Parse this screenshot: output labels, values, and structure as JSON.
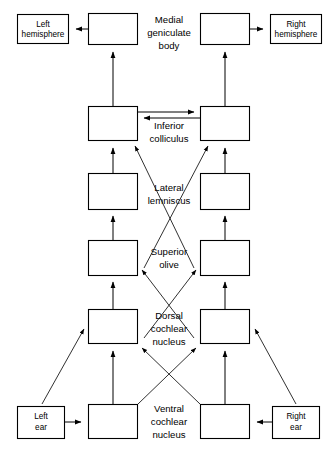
{
  "diagram": {
    "colors": {
      "stroke": "#000000",
      "background": "#ffffff",
      "box_fill": "#ffffff"
    },
    "boxes": [
      {
        "id": "left-hemisphere",
        "label_line1": "Left",
        "label_line2": "hemisphere",
        "x": 17,
        "y": 14,
        "w": 52,
        "h": 30
      },
      {
        "id": "right-hemisphere",
        "label_line1": "Right",
        "label_line2": "hemisphere",
        "x": 270,
        "y": 14,
        "w": 52,
        "h": 30
      },
      {
        "id": "mgb-left",
        "label_line1": "",
        "label_line2": "",
        "x": 88,
        "y": 13,
        "w": 50,
        "h": 32
      },
      {
        "id": "mgb-right",
        "label_line1": "",
        "label_line2": "",
        "x": 200,
        "y": 13,
        "w": 50,
        "h": 32
      },
      {
        "id": "ic-left",
        "label_line1": "",
        "label_line2": "",
        "x": 88,
        "y": 106,
        "w": 50,
        "h": 35
      },
      {
        "id": "ic-right",
        "label_line1": "",
        "label_line2": "",
        "x": 200,
        "y": 106,
        "w": 50,
        "h": 35
      },
      {
        "id": "ll-left",
        "label_line1": "",
        "label_line2": "",
        "x": 88,
        "y": 173,
        "w": 50,
        "h": 37
      },
      {
        "id": "ll-right",
        "label_line1": "",
        "label_line2": "",
        "x": 200,
        "y": 173,
        "w": 50,
        "h": 37
      },
      {
        "id": "so-left",
        "label_line1": "",
        "label_line2": "",
        "x": 88,
        "y": 240,
        "w": 50,
        "h": 36
      },
      {
        "id": "so-right",
        "label_line1": "",
        "label_line2": "",
        "x": 200,
        "y": 240,
        "w": 50,
        "h": 36
      },
      {
        "id": "dcn-left",
        "label_line1": "",
        "label_line2": "",
        "x": 88,
        "y": 309,
        "w": 50,
        "h": 35
      },
      {
        "id": "dcn-right",
        "label_line1": "",
        "label_line2": "",
        "x": 200,
        "y": 309,
        "w": 50,
        "h": 35
      },
      {
        "id": "vcn-left",
        "label_line1": "",
        "label_line2": "",
        "x": 88,
        "y": 404,
        "w": 50,
        "h": 35
      },
      {
        "id": "vcn-right",
        "label_line1": "",
        "label_line2": "",
        "x": 200,
        "y": 404,
        "w": 50,
        "h": 35
      },
      {
        "id": "left-ear",
        "label_line1": "Left",
        "label_line2": "ear",
        "x": 17,
        "y": 406,
        "w": 48,
        "h": 33
      },
      {
        "id": "right-ear",
        "label_line1": "Right",
        "label_line2": "ear",
        "x": 272,
        "y": 406,
        "w": 48,
        "h": 33
      }
    ],
    "center_labels": [
      {
        "id": "medial-geniculate-body",
        "lines": [
          "Medial",
          "geniculate",
          "body"
        ],
        "cx": 169,
        "cy": 30
      },
      {
        "id": "inferior-colliculus",
        "lines": [
          "Inferior",
          "colliculus"
        ],
        "cx": 169,
        "cy": 128
      },
      {
        "id": "lateral-lemniscus",
        "lines": [
          "Lateral",
          "lemniscus"
        ],
        "cx": 169,
        "cy": 191
      },
      {
        "id": "superior-olive",
        "lines": [
          "Superior",
          "olive"
        ],
        "cx": 169,
        "cy": 257
      },
      {
        "id": "dorsal-cochlear-nucleus",
        "lines": [
          "Dorsal",
          "cochlear",
          "nucleus"
        ],
        "cx": 169,
        "cy": 325
      },
      {
        "id": "ventral-cochlear-nucleus",
        "lines": [
          "Ventral",
          "cochlear",
          "nucleus"
        ],
        "cx": 169,
        "cy": 421
      }
    ],
    "connections": [
      {
        "id": "mgb-left-to-left-hemisphere",
        "from": "mgb-left",
        "to": "left-hemisphere",
        "kind": "arrow-left"
      },
      {
        "id": "mgb-right-to-right-hemisphere",
        "from": "mgb-right",
        "to": "right-hemisphere",
        "kind": "arrow-right"
      },
      {
        "id": "ic-left-to-mgb-left",
        "from": "ic-left",
        "to": "mgb-left",
        "kind": "arrow-up"
      },
      {
        "id": "ic-right-to-mgb-right",
        "from": "ic-right",
        "to": "mgb-right",
        "kind": "arrow-up"
      },
      {
        "id": "ic-left-to-ic-right",
        "from": "ic-left",
        "to": "ic-right",
        "kind": "arrow-right"
      },
      {
        "id": "ic-right-to-ic-left",
        "from": "ic-right",
        "to": "ic-left",
        "kind": "arrow-left"
      },
      {
        "id": "ll-left-to-ic-left",
        "from": "ll-left",
        "to": "ic-left",
        "kind": "arrow-up"
      },
      {
        "id": "ll-right-to-ic-right",
        "from": "ll-right",
        "to": "ic-right",
        "kind": "arrow-up"
      },
      {
        "id": "so-left-to-ll-left",
        "from": "so-left",
        "to": "ll-left",
        "kind": "arrow-up"
      },
      {
        "id": "so-right-to-ll-right",
        "from": "so-right",
        "to": "ll-right",
        "kind": "arrow-up"
      },
      {
        "id": "so-left-cross-to-ic-right",
        "from": "so-left",
        "to": "ic-right",
        "kind": "diagonal-arrow"
      },
      {
        "id": "so-right-cross-to-ic-left",
        "from": "so-right",
        "to": "ic-left",
        "kind": "diagonal-arrow"
      },
      {
        "id": "dcn-left-to-so-left",
        "from": "dcn-left",
        "to": "so-left",
        "kind": "arrow-up"
      },
      {
        "id": "dcn-right-to-so-right",
        "from": "dcn-right",
        "to": "so-right",
        "kind": "arrow-up"
      },
      {
        "id": "dcn-left-cross-to-so-right",
        "from": "dcn-left",
        "to": "so-right",
        "kind": "diagonal-arrow"
      },
      {
        "id": "dcn-right-cross-to-so-left",
        "from": "dcn-right",
        "to": "so-left",
        "kind": "diagonal-arrow"
      },
      {
        "id": "vcn-left-to-dcn-left",
        "from": "vcn-left",
        "to": "dcn-left",
        "kind": "arrow-up"
      },
      {
        "id": "vcn-right-to-dcn-right",
        "from": "vcn-right",
        "to": "dcn-right",
        "kind": "arrow-up"
      },
      {
        "id": "vcn-left-cross-to-dcn-right",
        "from": "vcn-left",
        "to": "dcn-right",
        "kind": "diagonal-arrow"
      },
      {
        "id": "vcn-right-cross-to-dcn-left",
        "from": "vcn-right",
        "to": "dcn-left",
        "kind": "diagonal-arrow"
      },
      {
        "id": "left-ear-to-vcn-left",
        "from": "left-ear",
        "to": "vcn-left",
        "kind": "arrow-right"
      },
      {
        "id": "right-ear-to-vcn-right",
        "from": "right-ear",
        "to": "vcn-right",
        "kind": "arrow-left"
      },
      {
        "id": "left-ear-to-dcn-left",
        "from": "left-ear",
        "to": "dcn-left",
        "kind": "diagonal-arrow"
      },
      {
        "id": "right-ear-to-dcn-right",
        "from": "right-ear",
        "to": "dcn-right",
        "kind": "diagonal-arrow"
      }
    ]
  }
}
